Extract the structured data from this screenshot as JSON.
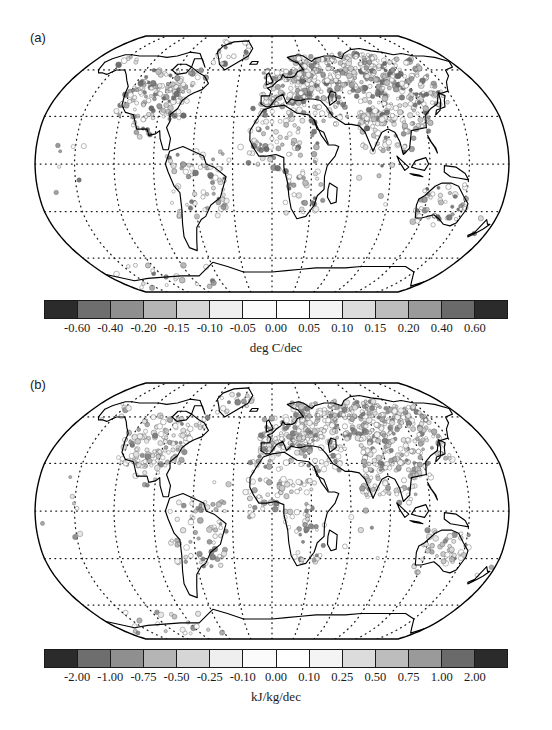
{
  "figure": {
    "faint_header": "",
    "panels": [
      {
        "label": "(a)",
        "unit": "deg C/dec",
        "map_name": "global-trend-map-temperature"
      },
      {
        "label": "(b)",
        "unit": "kJ/kg/dec",
        "map_name": "global-trend-map-enthalpy"
      }
    ]
  },
  "chart_data": {
    "type": "heatmap",
    "title": "",
    "subtitle": "",
    "projection": "Robinson",
    "grid": true,
    "legend_position": "bottom",
    "panels": [
      {
        "panel": "(a)",
        "label": "(a)",
        "variable": "Surface air temperature trend",
        "unit": "deg C/dec",
        "xlabel": "",
        "ylabel": "",
        "colorbar": {
          "tick_labels": [
            "-0.60",
            "-0.40",
            "-0.20",
            "-0.15",
            "-0.10",
            "-0.05",
            "0.00",
            "0.05",
            "0.10",
            "0.15",
            "0.20",
            "0.40",
            "0.60"
          ],
          "tick_values": [
            -0.6,
            -0.4,
            -0.2,
            -0.15,
            -0.1,
            -0.05,
            0.0,
            0.05,
            0.1,
            0.15,
            0.2,
            0.4,
            0.6
          ],
          "n_cells": 14,
          "cell_colors": [
            "#2b2b2b",
            "#6e6e6e",
            "#8f8f8f",
            "#b5b5b5",
            "#d6d6d6",
            "#efefef",
            "#fbfbfb",
            "#ffffff",
            "#f4f4f4",
            "#dcdcdc",
            "#bdbdbd",
            "#9a9a9a",
            "#6a6a6a",
            "#2b2b2b"
          ],
          "orientation": "horizontal",
          "diverging": true
        },
        "graticule": {
          "lon_interval_deg": 30,
          "lat_interval_deg": 30,
          "style": "dotted"
        },
        "data_description": "Station trend circles, densest over Eurasia, North America, and Europe; mid-to-dark gray positive values dominate Northern Hemisphere land; sparse light circles over oceans and Southern Hemisphere."
      },
      {
        "panel": "(b)",
        "label": "(b)",
        "variable": "Surface moist enthalpy trend",
        "unit": "kJ/kg/dec",
        "xlabel": "",
        "ylabel": "",
        "colorbar": {
          "tick_labels": [
            "-2.00",
            "-1.00",
            "-0.75",
            "-0.50",
            "-0.25",
            "-0.10",
            "0.00",
            "0.10",
            "0.25",
            "0.50",
            "0.75",
            "1.00",
            "2.00"
          ],
          "tick_values": [
            -2.0,
            -1.0,
            -0.75,
            -0.5,
            -0.25,
            -0.1,
            0.0,
            0.1,
            0.25,
            0.5,
            0.75,
            1.0,
            2.0
          ],
          "n_cells": 14,
          "cell_colors": [
            "#2b2b2b",
            "#6e6e6e",
            "#8f8f8f",
            "#b5b5b5",
            "#d6d6d6",
            "#efefef",
            "#fbfbfb",
            "#ffffff",
            "#f4f4f4",
            "#dcdcdc",
            "#bdbdbd",
            "#9a9a9a",
            "#6a6a6a",
            "#2b2b2b"
          ],
          "orientation": "horizontal",
          "diverging": true
        },
        "graticule": {
          "lon_interval_deg": 30,
          "lat_interval_deg": 30,
          "style": "dotted"
        },
        "data_description": "Station trend circles with lighter mid-gray tones than panel (a); dense coverage over Eurasia and North America; many open light circles indicating near-zero to small positive enthalpy trends."
      }
    ]
  }
}
